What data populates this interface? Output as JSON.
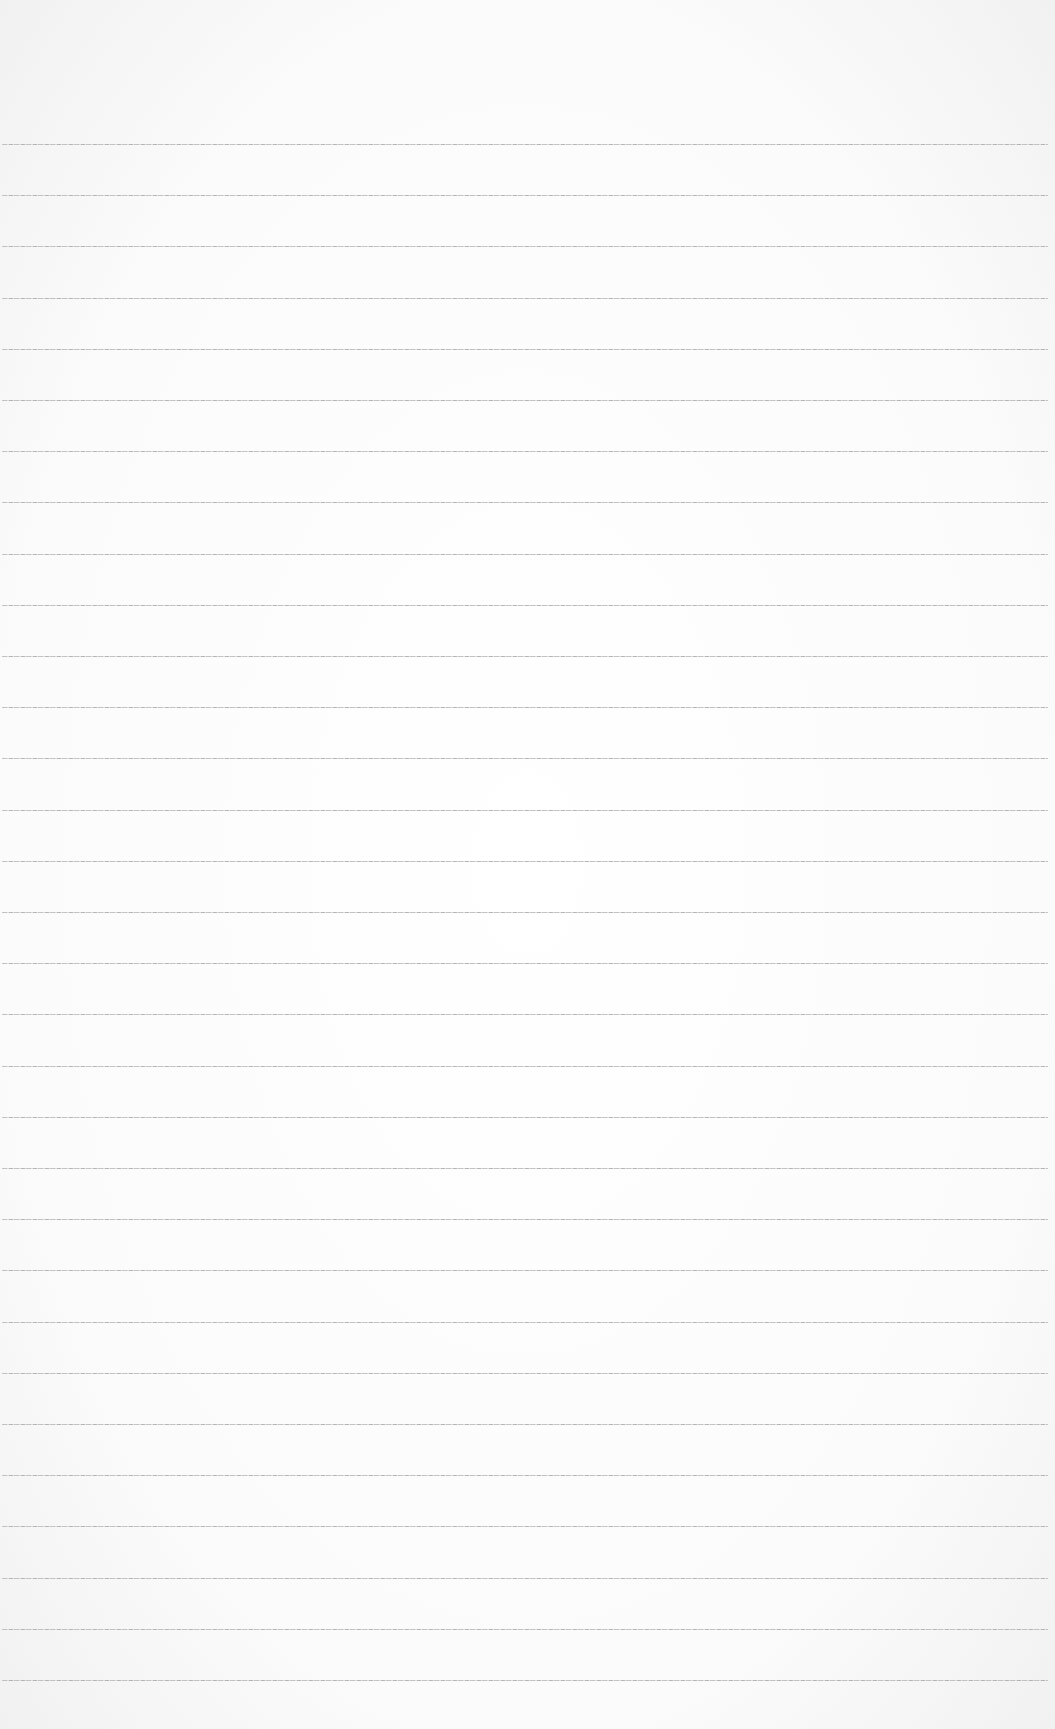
{
  "page": {
    "type": "lined-paper",
    "background_color": "#fdfdfd",
    "line_color": "#b8b8b8",
    "line_count": 31,
    "first_line_y": 144,
    "line_spacing": 51.2,
    "line_left": 2,
    "line_right": 1048
  }
}
